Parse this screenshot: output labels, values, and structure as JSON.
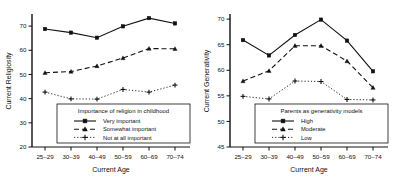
{
  "chart_data": [
    {
      "type": "line",
      "panel": "left",
      "title": "",
      "xlabel": "Current Age",
      "ylabel": "Current Religiosity",
      "categories": [
        "25–29",
        "30–39",
        "40–49",
        "50–59",
        "60–69",
        "70–74"
      ],
      "ylim": [
        20,
        75
      ],
      "yticks": [
        20,
        30,
        40,
        50,
        60,
        70
      ],
      "grid": false,
      "legend_position": "bottom-right",
      "legend_title": "Importance of religion in childhood",
      "series": [
        {
          "name": "Very important",
          "marker": "square",
          "line": "solid",
          "values": [
            68.8,
            67.3,
            65.2,
            69.9,
            73.3,
            71.1
          ]
        },
        {
          "name": "Somewhat important",
          "marker": "triangle",
          "line": "dashed",
          "values": [
            50.7,
            51.2,
            53.5,
            56.8,
            60.7,
            60.6
          ]
        },
        {
          "name": "Not at all important",
          "marker": "plus",
          "line": "dotted",
          "values": [
            42.7,
            39.9,
            39.8,
            43.8,
            42.7,
            45.6
          ]
        }
      ]
    },
    {
      "type": "line",
      "panel": "right",
      "title": "",
      "xlabel": "Current Age",
      "ylabel": "Current Generativity",
      "categories": [
        "25–29",
        "30–39",
        "40–49",
        "50–59",
        "60–69",
        "70–74"
      ],
      "ylim": [
        45,
        71
      ],
      "yticks": [
        45,
        50,
        55,
        60,
        65,
        70
      ],
      "grid": false,
      "legend_position": "bottom-right",
      "legend_title": "Parents as generativity models",
      "series": [
        {
          "name": "High",
          "marker": "square",
          "line": "solid",
          "values": [
            65.9,
            62.9,
            66.9,
            69.9,
            65.8,
            59.8
          ]
        },
        {
          "name": "Moderate",
          "marker": "triangle",
          "line": "dashed",
          "values": [
            57.9,
            59.9,
            64.8,
            64.8,
            61.8,
            56.6
          ]
        },
        {
          "name": "Low",
          "marker": "plus",
          "line": "dotted",
          "values": [
            54.9,
            54.4,
            57.9,
            57.8,
            54.3,
            54.2
          ]
        }
      ]
    }
  ],
  "colors": {
    "ink": "#111111",
    "background": "#ffffff",
    "legend_border": "#111111"
  }
}
